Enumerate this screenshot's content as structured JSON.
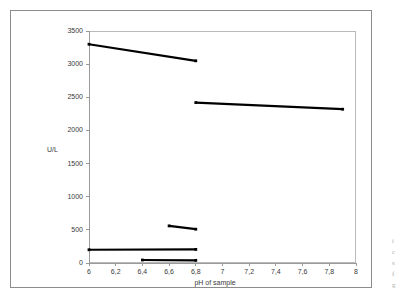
{
  "figure": {
    "background_color": "#ffffff",
    "border_color": "#8c8c8c",
    "plot_frame_color": "#b9b9b9",
    "series_color": "#000000"
  },
  "side_caption": {
    "line1": "i",
    "line2": "c",
    "line3": "s",
    "line4": "f",
    "line5": "g"
  },
  "chart_data": {
    "type": "line",
    "title": "",
    "xlabel": "pH of sample",
    "ylabel": "U/L",
    "xlim": [
      6,
      8
    ],
    "ylim": [
      0,
      3500
    ],
    "grid": false,
    "legend": "none",
    "xticks": [
      6,
      6.2,
      6.4,
      6.6,
      6.8,
      7,
      7.2,
      7.4,
      7.6,
      7.8,
      8
    ],
    "xtick_labels": [
      "6",
      "6,2",
      "6,4",
      "6,6",
      "6,8",
      "7",
      "7,2",
      "7,4",
      "7,6",
      "7,8",
      "8"
    ],
    "yticks": [
      0,
      500,
      1000,
      1500,
      2000,
      2500,
      3000,
      3500
    ],
    "ytick_labels": [
      "0",
      "500",
      "1000",
      "1500",
      "2000",
      "2500",
      "3000",
      "3500"
    ],
    "series": [
      {
        "name": "segment-1",
        "x": [
          6.0,
          6.8
        ],
        "values": [
          3300,
          3050
        ]
      },
      {
        "name": "segment-2",
        "x": [
          6.8,
          7.9
        ],
        "values": [
          2420,
          2320
        ]
      },
      {
        "name": "segment-3",
        "x": [
          6.6,
          6.8
        ],
        "values": [
          560,
          510
        ]
      },
      {
        "name": "segment-4",
        "x": [
          6.0,
          6.8
        ],
        "values": [
          200,
          205
        ]
      },
      {
        "name": "segment-5",
        "x": [
          6.4,
          6.8
        ],
        "values": [
          45,
          40
        ]
      }
    ]
  }
}
